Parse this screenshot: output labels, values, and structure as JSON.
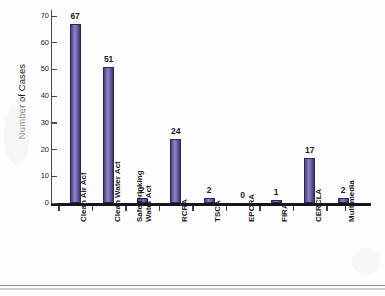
{
  "chart_data": {
    "type": "bar",
    "title": "",
    "xlabel": "",
    "ylabel": "Number of Cases",
    "ylim": [
      0,
      70
    ],
    "ytick_labels": [
      "0",
      "10",
      "20",
      "30",
      "40",
      "50",
      "60",
      "70"
    ],
    "yticks": [
      0,
      10,
      20,
      30,
      40,
      50,
      60,
      70
    ],
    "grid": false,
    "legend": false,
    "categories": [
      "Clean Air Act",
      "Clean Water Act",
      "Safe Drinking Water Act",
      "RCRA",
      "TSCA",
      "EPCRA",
      "FIRA",
      "CERCLA",
      "Multimedia"
    ],
    "category_lines": [
      [
        "Clean Air Act"
      ],
      [
        "Clean Water Act"
      ],
      [
        "Safe Drinking",
        "Water Act"
      ],
      [
        "RCRA"
      ],
      [
        "TSCA"
      ],
      [
        "EPCRA"
      ],
      [
        "FIRA"
      ],
      [
        "CERCLA"
      ],
      [
        "Multimedia"
      ]
    ],
    "values": [
      67,
      51,
      2,
      24,
      2,
      0,
      1,
      17,
      2
    ],
    "value_labels": [
      "67",
      "51",
      "2",
      "24",
      "2",
      "0",
      "1",
      "17",
      "2"
    ],
    "bar_color": "#5a4f95",
    "axis_color": "#15151c"
  }
}
